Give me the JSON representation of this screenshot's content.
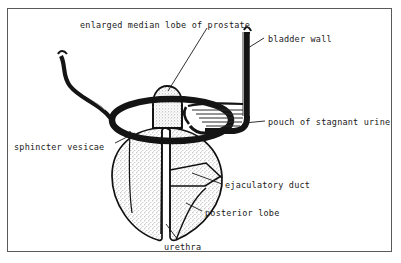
{
  "figure": {
    "kind": "anatomical-line-diagram",
    "frame": {
      "border_color": "#5a5a5a",
      "background": "#ffffff"
    },
    "ink_color": "#111111",
    "stipple_color": "#9a9a9a",
    "labels": [
      {
        "id": "median-lobe",
        "text": "enlarged median lobe of prostate"
      },
      {
        "id": "bladder-wall",
        "text": "bladder wall"
      },
      {
        "id": "pouch",
        "text": "pouch of stagnant urine"
      },
      {
        "id": "sphincter",
        "text": "sphincter vesicae"
      },
      {
        "id": "ejaculatory",
        "text": "ejaculatory duct"
      },
      {
        "id": "posterior",
        "text": "posterior lobe"
      },
      {
        "id": "urethra",
        "text": "urethra"
      }
    ],
    "structures": [
      {
        "id": "median-lobe-dome",
        "description": "stippled dome projecting upward into bladder neck"
      },
      {
        "id": "sphincter-ring",
        "description": "heavy dark ellipse encircling the bladder neck"
      },
      {
        "id": "prostate-body",
        "description": "large stippled oval gland below the sphincter ring"
      },
      {
        "id": "urethral-channel",
        "description": "narrow vertical channel through the gland"
      },
      {
        "id": "ejaculatory-duct-line",
        "description": "oblique duct crossing the posterior lobe"
      },
      {
        "id": "bladder-wall-strip",
        "description": "thick vertical dark band at right, turning left at base"
      },
      {
        "id": "urine-pouch-hatch",
        "description": "horizontal hatch lines indicating residual urine level"
      },
      {
        "id": "ureter-vessel",
        "description": "wavy dark tube entering from upper left"
      }
    ]
  }
}
